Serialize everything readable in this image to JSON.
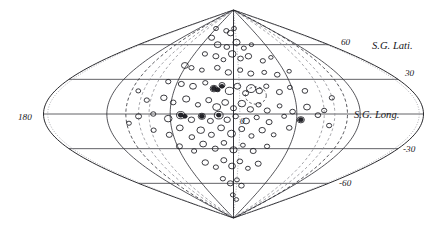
{
  "figure": {
    "name": "supergalactic-sky-map",
    "projection": "sinusoidal",
    "background_color": "#ffffff",
    "ink_color": "#1a1a20"
  },
  "labels": {
    "sg_latitude": "S.G. Lati.",
    "sg_longitude": "S.G. Long.",
    "longitude_left": "180",
    "longitude_center": "0"
  },
  "latitude_ticks": [
    {
      "text": "60",
      "value": 60
    },
    {
      "text": "30",
      "value": 30
    },
    {
      "text": "-30",
      "value": -30
    },
    {
      "text": "-60",
      "value": -60
    }
  ],
  "chart_data": {
    "type": "scatter",
    "title": "",
    "subtitle": "",
    "xlabel": "S.G. Long.",
    "ylabel": "S.G. Lati.",
    "projection": "sinusoidal",
    "grid": true,
    "legend": "none",
    "xlim": [
      -180,
      180
    ],
    "ylim": [
      -90,
      90
    ],
    "x_tick_labels": [
      "180",
      "0"
    ],
    "y_tick_labels": [
      "60",
      "30",
      "-30",
      "-60"
    ],
    "graticule": {
      "parallels": [
        60,
        30,
        0,
        -30,
        -60
      ],
      "meridians": [
        -180,
        -120,
        -60,
        0,
        60,
        120,
        180
      ],
      "pole_north": 90,
      "pole_south": -90
    },
    "annotations": [
      {
        "name": "cluster-ring",
        "type": "dashed-circle",
        "lon": 22,
        "lat": 16,
        "radius_deg": 9
      },
      {
        "name": "galactic-plane-band",
        "type": "dashed-curve-pair",
        "style": "zone-of-avoidance"
      }
    ],
    "marker_shape": "open-ellipse",
    "points": [
      {
        "lon": -51,
        "lat": 66,
        "size": 3.0
      },
      {
        "lon": -22,
        "lat": 72,
        "size": 2.6
      },
      {
        "lon": -8,
        "lat": 70,
        "size": 3.2
      },
      {
        "lon": 2,
        "lat": 74,
        "size": 2.4
      },
      {
        "lon": -30,
        "lat": 60,
        "size": 3.4
      },
      {
        "lon": -12,
        "lat": 58,
        "size": 2.8
      },
      {
        "lon": 6,
        "lat": 62,
        "size": 3.6
      },
      {
        "lon": 18,
        "lat": 57,
        "size": 2.5
      },
      {
        "lon": 34,
        "lat": 60,
        "size": 2.2
      },
      {
        "lon": -44,
        "lat": 52,
        "size": 2.6
      },
      {
        "lon": -26,
        "lat": 50,
        "size": 3.0
      },
      {
        "lon": -14,
        "lat": 47,
        "size": 2.4
      },
      {
        "lon": -2,
        "lat": 52,
        "size": 3.8
      },
      {
        "lon": 10,
        "lat": 48,
        "size": 2.8
      },
      {
        "lon": 22,
        "lat": 50,
        "size": 3.2
      },
      {
        "lon": 40,
        "lat": 46,
        "size": 2.6
      },
      {
        "lon": 54,
        "lat": 49,
        "size": 2.2
      },
      {
        "lon": -62,
        "lat": 42,
        "size": 3.4
      },
      {
        "lon": -52,
        "lat": 40,
        "size": 2.6
      },
      {
        "lon": -38,
        "lat": 38,
        "size": 2.4
      },
      {
        "lon": -20,
        "lat": 40,
        "size": 2.8
      },
      {
        "lon": -6,
        "lat": 36,
        "size": 3.2
      },
      {
        "lon": 8,
        "lat": 38,
        "size": 2.6
      },
      {
        "lon": 20,
        "lat": 35,
        "size": 3.0
      },
      {
        "lon": 36,
        "lat": 36,
        "size": 2.4
      },
      {
        "lon": 50,
        "lat": 34,
        "size": 2.8
      },
      {
        "lon": 66,
        "lat": 37,
        "size": 2.2
      },
      {
        "lon": -70,
        "lat": 28,
        "size": 2.6
      },
      {
        "lon": -55,
        "lat": 26,
        "size": 3.0
      },
      {
        "lon": -42,
        "lat": 24,
        "size": 3.4
      },
      {
        "lon": -30,
        "lat": 27,
        "size": 2.6
      },
      {
        "lon": -20,
        "lat": 22,
        "size": 3.8
      },
      {
        "lon": -12,
        "lat": 25,
        "size": 3.0
      },
      {
        "lon": -4,
        "lat": 20,
        "size": 4.2
      },
      {
        "lon": 4,
        "lat": 24,
        "size": 3.4
      },
      {
        "lon": 12,
        "lat": 18,
        "size": 3.0
      },
      {
        "lon": 18,
        "lat": 22,
        "size": 4.6
      },
      {
        "lon": 26,
        "lat": 20,
        "size": 3.2
      },
      {
        "lon": 34,
        "lat": 24,
        "size": 2.6
      },
      {
        "lon": 46,
        "lat": 19,
        "size": 3.0
      },
      {
        "lon": 58,
        "lat": 23,
        "size": 2.4
      },
      {
        "lon": 72,
        "lat": 20,
        "size": 2.8
      },
      {
        "lon": -84,
        "lat": 12,
        "size": 2.6
      },
      {
        "lon": -68,
        "lat": 14,
        "size": 3.2
      },
      {
        "lon": -58,
        "lat": 10,
        "size": 2.8
      },
      {
        "lon": -46,
        "lat": 13,
        "size": 3.6
      },
      {
        "lon": -34,
        "lat": 8,
        "size": 2.6
      },
      {
        "lon": -24,
        "lat": 12,
        "size": 3.0
      },
      {
        "lon": -16,
        "lat": 6,
        "size": 4.0
      },
      {
        "lon": -8,
        "lat": 10,
        "size": 3.4
      },
      {
        "lon": 0,
        "lat": 5,
        "size": 3.0
      },
      {
        "lon": 8,
        "lat": 9,
        "size": 3.8
      },
      {
        "lon": 16,
        "lat": 4,
        "size": 3.2
      },
      {
        "lon": 24,
        "lat": 8,
        "size": 2.6
      },
      {
        "lon": 32,
        "lat": 3,
        "size": 3.0
      },
      {
        "lon": 44,
        "lat": 7,
        "size": 2.4
      },
      {
        "lon": 56,
        "lat": 2,
        "size": 2.8
      },
      {
        "lon": 70,
        "lat": 6,
        "size": 3.4
      },
      {
        "lon": 86,
        "lat": 3,
        "size": 2.6
      },
      {
        "lon": -90,
        "lat": -2,
        "size": 3.0
      },
      {
        "lon": -76,
        "lat": 0,
        "size": 2.6
      },
      {
        "lon": -62,
        "lat": -4,
        "size": 3.8
      },
      {
        "lon": -50,
        "lat": -1,
        "size": 4.2
      },
      {
        "lon": -40,
        "lat": -5,
        "size": 3.2
      },
      {
        "lon": -30,
        "lat": -2,
        "size": 3.6
      },
      {
        "lon": -22,
        "lat": -6,
        "size": 3.0
      },
      {
        "lon": -14,
        "lat": -1,
        "size": 4.4
      },
      {
        "lon": -6,
        "lat": -5,
        "size": 3.2
      },
      {
        "lon": 2,
        "lat": -2,
        "size": 2.8
      },
      {
        "lon": 12,
        "lat": -6,
        "size": 3.4
      },
      {
        "lon": 22,
        "lat": -3,
        "size": 2.6
      },
      {
        "lon": 34,
        "lat": -7,
        "size": 3.0
      },
      {
        "lon": 48,
        "lat": -2,
        "size": 2.4
      },
      {
        "lon": 64,
        "lat": -5,
        "size": 3.6
      },
      {
        "lon": 80,
        "lat": -1,
        "size": 2.8
      },
      {
        "lon": -78,
        "lat": -14,
        "size": 2.6
      },
      {
        "lon": -64,
        "lat": -18,
        "size": 3.0
      },
      {
        "lon": -52,
        "lat": -12,
        "size": 3.4
      },
      {
        "lon": -42,
        "lat": -20,
        "size": 2.8
      },
      {
        "lon": -32,
        "lat": -14,
        "size": 3.8
      },
      {
        "lon": -22,
        "lat": -18,
        "size": 3.0
      },
      {
        "lon": -12,
        "lat": -12,
        "size": 3.4
      },
      {
        "lon": -2,
        "lat": -17,
        "size": 4.0
      },
      {
        "lon": 8,
        "lat": -13,
        "size": 3.0
      },
      {
        "lon": 18,
        "lat": -19,
        "size": 2.6
      },
      {
        "lon": 28,
        "lat": -14,
        "size": 3.2
      },
      {
        "lon": 40,
        "lat": -18,
        "size": 2.4
      },
      {
        "lon": 54,
        "lat": -12,
        "size": 2.8
      },
      {
        "lon": -58,
        "lat": -28,
        "size": 3.0
      },
      {
        "lon": -44,
        "lat": -32,
        "size": 2.6
      },
      {
        "lon": -32,
        "lat": -26,
        "size": 3.4
      },
      {
        "lon": -20,
        "lat": -30,
        "size": 3.0
      },
      {
        "lon": -10,
        "lat": -25,
        "size": 2.8
      },
      {
        "lon": 0,
        "lat": -31,
        "size": 3.6
      },
      {
        "lon": 10,
        "lat": -27,
        "size": 2.4
      },
      {
        "lon": 22,
        "lat": -32,
        "size": 3.0
      },
      {
        "lon": 36,
        "lat": -28,
        "size": 2.6
      },
      {
        "lon": -36,
        "lat": -42,
        "size": 3.2
      },
      {
        "lon": -24,
        "lat": -46,
        "size": 2.6
      },
      {
        "lon": -12,
        "lat": -40,
        "size": 3.0
      },
      {
        "lon": -2,
        "lat": -45,
        "size": 3.4
      },
      {
        "lon": 8,
        "lat": -41,
        "size": 2.8
      },
      {
        "lon": 20,
        "lat": -47,
        "size": 2.4
      },
      {
        "lon": 32,
        "lat": -43,
        "size": 3.0
      },
      {
        "lon": -18,
        "lat": -56,
        "size": 2.6
      },
      {
        "lon": -6,
        "lat": -60,
        "size": 3.0
      },
      {
        "lon": 6,
        "lat": -57,
        "size": 2.4
      },
      {
        "lon": 16,
        "lat": -62,
        "size": 2.8
      },
      {
        "lon": -2,
        "lat": -70,
        "size": 2.4
      },
      {
        "lon": 10,
        "lat": -74,
        "size": 2.2
      },
      {
        "lon": -60,
        "lat": 74,
        "size": 2.4
      },
      {
        "lon": -96,
        "lat": 20,
        "size": 2.4
      },
      {
        "lon": 96,
        "lat": 14,
        "size": 2.6
      },
      {
        "lon": -100,
        "lat": -8,
        "size": 2.4
      },
      {
        "lon": 92,
        "lat": -10,
        "size": 2.6
      }
    ],
    "filled_points": [
      {
        "lon": -20,
        "lat": 22,
        "size": 2.6
      },
      {
        "lon": -16,
        "lat": 21,
        "size": 2.4
      },
      {
        "lon": -50,
        "lat": -1,
        "size": 2.4
      },
      {
        "lon": -46,
        "lat": -2,
        "size": 2.2
      },
      {
        "lon": -30,
        "lat": -2,
        "size": 2.4
      },
      {
        "lon": 64,
        "lat": -5,
        "size": 2.4
      },
      {
        "lon": -14,
        "lat": -1,
        "size": 2.2
      },
      {
        "lon": -12,
        "lat": 24,
        "size": 2.2
      }
    ]
  }
}
